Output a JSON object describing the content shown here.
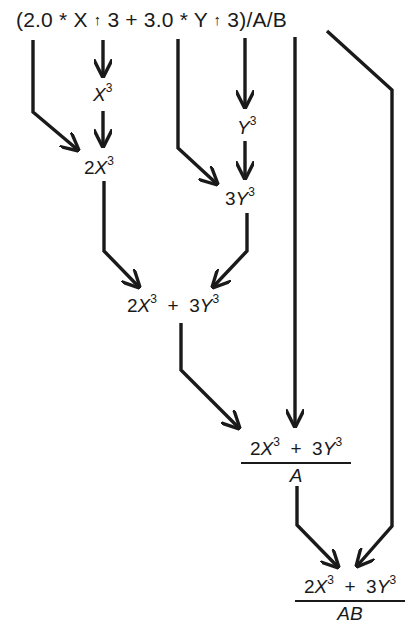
{
  "diagram": {
    "title": "",
    "expression": {
      "p1": "(2.0 * X",
      "op1": "↑",
      "p2": "3 + 3.0 * Y",
      "op2": "↑",
      "p3": "3)/A/B"
    },
    "nodes": {
      "x_cubed": {
        "base": "X",
        "exp": "3"
      },
      "two_x_cubed": {
        "coef": "2",
        "base": "X",
        "exp": "3"
      },
      "y_cubed": {
        "base": "Y",
        "exp": "3"
      },
      "three_y_cubed": {
        "coef": "3",
        "base": "Y",
        "exp": "3"
      },
      "sum": {
        "c1": "2",
        "b1": "X",
        "e1": "3",
        "plus": "+",
        "c2": "3",
        "b2": "Y",
        "e2": "3"
      },
      "frac_a": {
        "c1": "2",
        "b1": "X",
        "e1": "3",
        "plus": "+",
        "c2": "3",
        "b2": "Y",
        "e2": "3",
        "den": "A"
      },
      "frac_ab": {
        "c1": "2",
        "b1": "X",
        "e1": "3",
        "plus": "+",
        "c2": "3",
        "b2": "Y",
        "e2": "3",
        "den": "AB"
      }
    },
    "colors": {
      "line": "#1a1a1a",
      "background": "#ffffff"
    }
  }
}
